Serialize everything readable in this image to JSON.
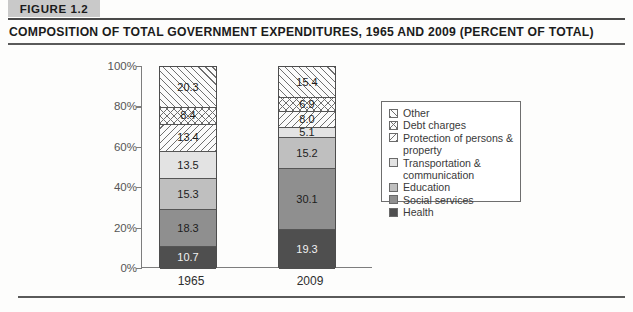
{
  "figure": {
    "tag": "FIGURE 1.2",
    "title": "COMPOSITION OF TOTAL GOVERNMENT EXPENDITURES, 1965 AND 2009 (PERCENT OF TOTAL)"
  },
  "axis": {
    "y_ticks": [
      "100%",
      "80%",
      "60%",
      "40%",
      "20%",
      "0%"
    ],
    "x_categories": [
      "1965",
      "2009"
    ]
  },
  "legend": {
    "items": [
      {
        "label": "Other",
        "swatch": "diagonal-forward-hatch"
      },
      {
        "label": "Debt charges",
        "swatch": "cross-hatch"
      },
      {
        "label": "Protection of persons &\nproperty",
        "swatch": "diagonal-back-hatch"
      },
      {
        "label": "Transportation &\ncommunication",
        "swatch": "light-gray-fill"
      },
      {
        "label": "Education",
        "swatch": "medium-light-gray-fill"
      },
      {
        "label": "Social services",
        "swatch": "medium-gray-fill"
      },
      {
        "label": "Health",
        "swatch": "dark-gray-fill"
      }
    ]
  },
  "colors": {
    "tag_background": "#c9c9c9",
    "transportation": "#e3e3e3",
    "education": "#bfbfbf",
    "social_services": "#8f8f8f",
    "health": "#4f4f4f",
    "hatch_stroke": "#6f6f6f",
    "axis": "#7d7d7d"
  },
  "chart_data": {
    "type": "bar",
    "stacked": true,
    "title": "COMPOSITION OF TOTAL GOVERNMENT EXPENDITURES, 1965 AND 2009 (PERCENT OF TOTAL)",
    "xlabel": "",
    "ylabel": "",
    "ylim": [
      0,
      100
    ],
    "yticks": [
      0,
      20,
      40,
      60,
      80,
      100
    ],
    "ytick_labels": [
      "0%",
      "20%",
      "40%",
      "60%",
      "80%",
      "100%"
    ],
    "grid": false,
    "legend_position": "right",
    "categories": [
      "1965",
      "2009"
    ],
    "series": [
      {
        "name": "Health",
        "values": [
          10.7,
          19.3
        ]
      },
      {
        "name": "Social services",
        "values": [
          18.3,
          30.1
        ]
      },
      {
        "name": "Education",
        "values": [
          15.3,
          15.2
        ]
      },
      {
        "name": "Transportation & communication",
        "values": [
          13.5,
          5.1
        ]
      },
      {
        "name": "Protection of persons & property",
        "values": [
          13.4,
          8.0
        ]
      },
      {
        "name": "Debt charges",
        "values": [
          8.4,
          6.9
        ]
      },
      {
        "name": "Other",
        "values": [
          20.3,
          15.4
        ]
      }
    ]
  },
  "bars": {
    "b1965": [
      {
        "value": "20.3",
        "style": "hatch-fwd",
        "h": 20.3,
        "dark": false
      },
      {
        "value": "8.4",
        "style": "hatch-cross",
        "h": 8.4,
        "dark": false
      },
      {
        "value": "13.4",
        "style": "hatch-back",
        "h": 13.4,
        "dark": false
      },
      {
        "value": "13.5",
        "style": "fill-l1",
        "h": 13.5,
        "dark": false
      },
      {
        "value": "15.3",
        "style": "fill-l2",
        "h": 15.3,
        "dark": false
      },
      {
        "value": "18.3",
        "style": "fill-l3",
        "h": 18.3,
        "dark": false
      },
      {
        "value": "10.7",
        "style": "fill-l4",
        "h": 10.7,
        "dark": true
      }
    ],
    "b2009": [
      {
        "value": "15.4",
        "style": "hatch-fwd",
        "h": 15.4,
        "dark": false
      },
      {
        "value": "6.9",
        "style": "hatch-cross",
        "h": 6.9,
        "dark": false
      },
      {
        "value": "8.0",
        "style": "hatch-back",
        "h": 8.0,
        "dark": false
      },
      {
        "value": "5.1",
        "style": "fill-l1",
        "h": 5.1,
        "dark": false
      },
      {
        "value": "15.2",
        "style": "fill-l2",
        "h": 15.2,
        "dark": false
      },
      {
        "value": "30.1",
        "style": "fill-l3",
        "h": 30.1,
        "dark": false
      },
      {
        "value": "19.3",
        "style": "fill-l4",
        "h": 19.3,
        "dark": true
      }
    ]
  }
}
